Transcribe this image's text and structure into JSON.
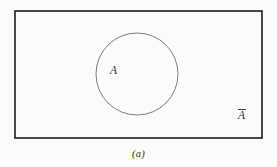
{
  "figure": {
    "kind": "venn-diagram",
    "caption": "(a)",
    "background_color": "#fbfbfa",
    "universe": {
      "name": "universal-set-rectangle",
      "shape": "rectangle",
      "x": 15,
      "y": 11,
      "width": 247,
      "height": 127,
      "stroke_color": "#1d1d1d",
      "stroke_width": 1.6,
      "fill": "none"
    },
    "set_a": {
      "name": "set-a-circle",
      "shape": "circle",
      "cx": 137,
      "cy": 74,
      "r": 41,
      "stroke_color": "#6e6e6e",
      "stroke_width": 0.9,
      "fill": "none"
    },
    "labels": {
      "inside": {
        "text": "A",
        "meaning": "set A",
        "x": 116,
        "y": 72
      },
      "outside": {
        "text": "A",
        "overline": true,
        "meaning": "complement of A",
        "x": 244,
        "y": 117
      }
    }
  }
}
